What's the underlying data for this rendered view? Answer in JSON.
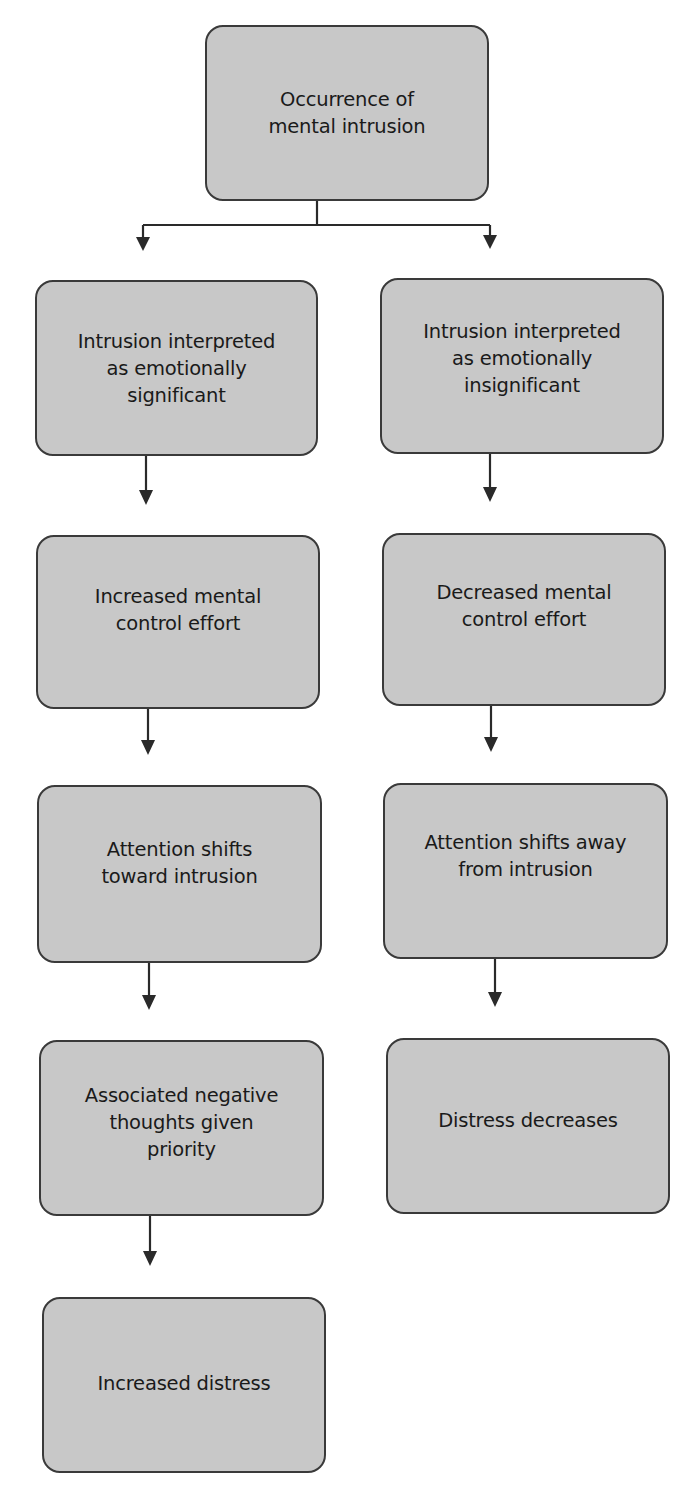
{
  "diagram": {
    "type": "flowchart",
    "colors": {
      "box_fill": "#c8c8c8",
      "box_border": "#3a3a3a",
      "text": "#1a1a1a",
      "arrow": "#2a2a2a",
      "background": "#ffffff"
    },
    "root": {
      "label": "Occurrence of\nmental intrusion"
    },
    "left_branch": [
      {
        "label": "Intrusion interpreted\nas emotionally\nsignificant"
      },
      {
        "label": "Increased mental\ncontrol effort"
      },
      {
        "label": "Attention shifts\ntoward intrusion"
      },
      {
        "label": "Associated negative\nthoughts given\npriority"
      },
      {
        "label": "Increased distress"
      }
    ],
    "right_branch": [
      {
        "label": "Intrusion interpreted\nas emotionally\ninsignificant"
      },
      {
        "label": "Decreased mental\ncontrol effort"
      },
      {
        "label": "Attention shifts away\nfrom intrusion"
      },
      {
        "label": "Distress decreases"
      }
    ],
    "edges": [
      {
        "from": "root",
        "to": "left_branch.0"
      },
      {
        "from": "root",
        "to": "right_branch.0"
      },
      {
        "from": "left_branch.0",
        "to": "left_branch.1"
      },
      {
        "from": "left_branch.1",
        "to": "left_branch.2"
      },
      {
        "from": "left_branch.2",
        "to": "left_branch.3"
      },
      {
        "from": "left_branch.3",
        "to": "left_branch.4"
      },
      {
        "from": "right_branch.0",
        "to": "right_branch.1"
      },
      {
        "from": "right_branch.1",
        "to": "right_branch.2"
      },
      {
        "from": "right_branch.2",
        "to": "right_branch.3"
      }
    ]
  }
}
